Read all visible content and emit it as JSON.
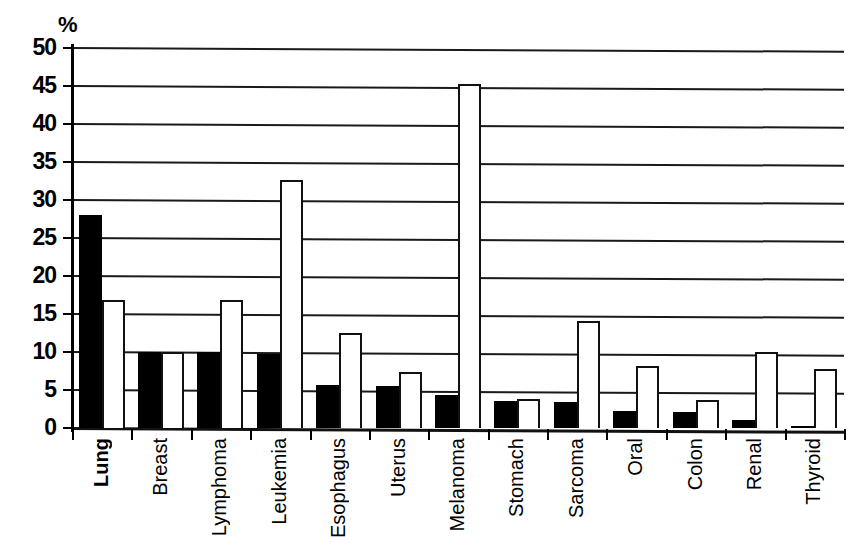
{
  "chart_data": {
    "type": "bar",
    "title": "",
    "subtitle": "",
    "xlabel": "",
    "ylabel": "%",
    "unit_label": "%",
    "ylim": [
      0,
      50
    ],
    "ytick_step": 5,
    "yticks": [
      "50",
      "45",
      "40",
      "35",
      "30",
      "25",
      "20",
      "15",
      "10",
      "5",
      "0"
    ],
    "grid": true,
    "grid_orientation": "horizontal",
    "legend": "none",
    "legend_entries": [],
    "categories": [
      "Lung",
      "Breast",
      "Lymphoma",
      "Leukemia",
      "Esophagus",
      "Uterus",
      "Melanoma",
      "Stomach",
      "Sarcoma",
      "Oral",
      "Colon",
      "Renal",
      "Thyroid"
    ],
    "emphasized_category": "Lung",
    "series": [
      {
        "name": "black",
        "fill": "#000000",
        "values": [
          28.0,
          10.0,
          10.0,
          9.8,
          5.6,
          5.5,
          4.3,
          3.5,
          3.4,
          2.2,
          2.1,
          1.0,
          0.3
        ]
      },
      {
        "name": "white",
        "fill": "#ffffff",
        "values": [
          16.9,
          10.0,
          16.8,
          32.6,
          12.5,
          7.4,
          45.2,
          3.8,
          14.1,
          8.1,
          3.7,
          10.0,
          7.7
        ]
      }
    ]
  },
  "colors": {
    "series_black": "#000000",
    "series_white": "#ffffff",
    "axis": "#000000",
    "grid": "#1a1a1a",
    "background": "#ffffff"
  }
}
